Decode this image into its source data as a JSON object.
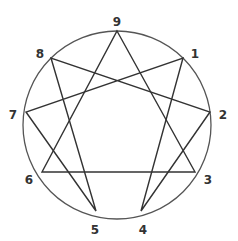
{
  "diagram": {
    "circle": {
      "cx": 117,
      "cy": 125,
      "r": 94,
      "stroke": "#555555"
    },
    "line_color": "#333333",
    "points": [
      {
        "label": "9",
        "x": 117,
        "y": 31,
        "lx": 117,
        "ly": 22
      },
      {
        "label": "1",
        "x": 183,
        "y": 58,
        "lx": 195,
        "ly": 54
      },
      {
        "label": "2",
        "x": 210,
        "y": 112,
        "lx": 223,
        "ly": 115
      },
      {
        "label": "3",
        "x": 195,
        "y": 172,
        "lx": 208,
        "ly": 180
      },
      {
        "label": "4",
        "x": 141,
        "y": 211,
        "lx": 143,
        "ly": 230
      },
      {
        "label": "5",
        "x": 96,
        "y": 211,
        "lx": 95,
        "ly": 230
      },
      {
        "label": "6",
        "x": 42,
        "y": 172,
        "lx": 29,
        "ly": 180
      },
      {
        "label": "7",
        "x": 26,
        "y": 112,
        "lx": 13,
        "ly": 115
      },
      {
        "label": "8",
        "x": 51,
        "y": 58,
        "lx": 40,
        "ly": 54
      }
    ],
    "triangle": [
      "9",
      "3",
      "6"
    ],
    "hexad": [
      "1",
      "4",
      "2",
      "8",
      "5",
      "7"
    ]
  }
}
